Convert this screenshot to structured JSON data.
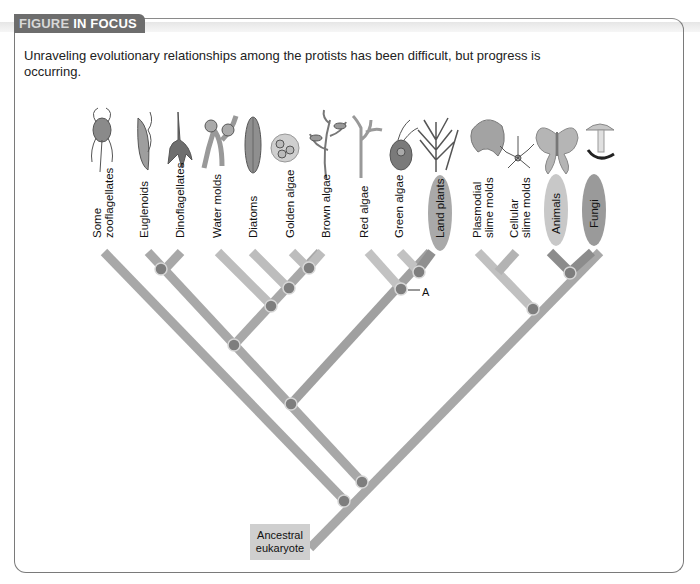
{
  "header": {
    "badge_part1": "FIGURE",
    "badge_part2": "IN FOCUS"
  },
  "intro": "Unraveling evolutionary relationships among the protists has been difficult, but progress is occurring.",
  "taxa": [
    {
      "label_line1": "Some",
      "label_line2": "zooflagellates",
      "icon": "zooflagellate-icon"
    },
    {
      "label_line1": "Euglenoids",
      "label_line2": "",
      "icon": "euglenoid-icon"
    },
    {
      "label_line1": "Dinoflagellates",
      "label_line2": "",
      "icon": "dinoflagellate-icon"
    },
    {
      "label_line1": "Water molds",
      "label_line2": "",
      "icon": "water-mold-icon"
    },
    {
      "label_line1": "Diatoms",
      "label_line2": "",
      "icon": "diatom-icon"
    },
    {
      "label_line1": "Golden algae",
      "label_line2": "",
      "icon": "golden-algae-icon"
    },
    {
      "label_line1": "Brown algae",
      "label_line2": "",
      "icon": "brown-algae-icon"
    },
    {
      "label_line1": "Red algae",
      "label_line2": "",
      "icon": "red-algae-icon"
    },
    {
      "label_line1": "Green algae",
      "label_line2": "",
      "icon": "green-algae-icon"
    },
    {
      "label_line1": "Land plants",
      "label_line2": "",
      "icon": "land-plant-icon",
      "highlighted": true
    },
    {
      "label_line1": "Plasmodial",
      "label_line2": "slime molds",
      "icon": "plasmodial-slime-mold-icon"
    },
    {
      "label_line1": "Cellular",
      "label_line2": "slime molds",
      "icon": "cellular-slime-mold-icon"
    },
    {
      "label_line1": "Animals",
      "label_line2": "",
      "icon": "moth-icon",
      "highlighted": true
    },
    {
      "label_line1": "Fungi",
      "label_line2": "",
      "icon": "mushroom-icon",
      "highlighted": true
    }
  ],
  "root_label_line1": "Ancestral",
  "root_label_line2": "eukaryote",
  "node_marker": "A",
  "colors": {
    "branch": "#a6a6a6",
    "branch_light": "#c4c4c4",
    "branch_dark": "#8a8a8a",
    "node": "#7e7e7e",
    "badge": "#6d6d6d",
    "oval_plants": "#a9a9a9",
    "oval_animals": "#c8c8c8",
    "oval_fungi": "#9a9a9a"
  }
}
